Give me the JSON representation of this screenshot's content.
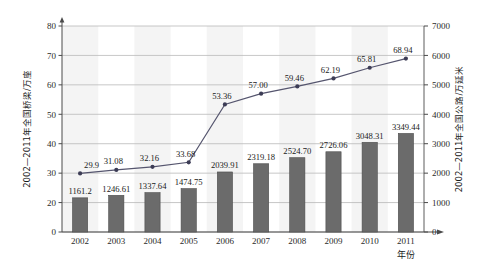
{
  "chart_data": {
    "type": "bar",
    "title": "",
    "subtitle": "",
    "xlabel": "年份",
    "categories": [
      "2002",
      "2003",
      "2004",
      "2005",
      "2006",
      "2007",
      "2008",
      "2009",
      "2010",
      "2011"
    ],
    "grid": true,
    "legend_position": "none",
    "axes": {
      "left": {
        "label": "2002—2011年全国桥梁/万座",
        "ticks": [
          "0",
          "20",
          "30",
          "40",
          "50",
          "60",
          "70",
          "80"
        ],
        "tick_values": [
          0,
          20,
          30,
          40,
          50,
          60,
          70,
          80
        ],
        "range": [
          0,
          80
        ],
        "note_break": "axis compressed between 0 and 20"
      },
      "right": {
        "label": "2002—2011年全国公路/万延米",
        "ticks": [
          "0",
          "1000",
          "2000",
          "3000",
          "4000",
          "5000",
          "6000",
          "7000"
        ],
        "tick_values": [
          0,
          1000,
          2000,
          3000,
          4000,
          5000,
          6000,
          7000
        ],
        "range": [
          0,
          7000
        ]
      },
      "bottom": {
        "label": "年份"
      }
    },
    "series": [
      {
        "name": "全国公路/万延米",
        "type": "bar",
        "axis": "right",
        "color": "#6b6b6b",
        "values": [
          1161.2,
          1246.61,
          1337.64,
          1474.75,
          2039.91,
          2319.18,
          2524.7,
          2726.06,
          3048.31,
          3349.44
        ],
        "labels": [
          "1161.2",
          "1246.61",
          "1337.64",
          "1474.75",
          "2039.91",
          "2319.18",
          "2524.70",
          "2726.06",
          "3048.31",
          "3349.44"
        ]
      },
      {
        "name": "全国桥梁/万座",
        "type": "line",
        "axis": "left",
        "color": "#4a4a66",
        "values": [
          29.9,
          31.08,
          32.16,
          33.68,
          53.36,
          57.0,
          59.46,
          62.19,
          65.81,
          68.94
        ],
        "labels": [
          "29.9",
          "31.08",
          "32.16",
          "33.68",
          "53.36",
          "57.00",
          "59.46",
          "62.19",
          "65.81",
          "68.94"
        ]
      }
    ]
  },
  "colors": {
    "bar_fill": "#6b6b6b",
    "bar_stroke": "#4d4d4d",
    "line_stroke": "#55556e",
    "marker_fill": "#3c3c55",
    "gridline": "#b9b9b9",
    "axis": "#4a4a4a",
    "band_light": "#f2f2f2",
    "plot_bg": "#ffffff",
    "text": "#1a1a1a"
  }
}
